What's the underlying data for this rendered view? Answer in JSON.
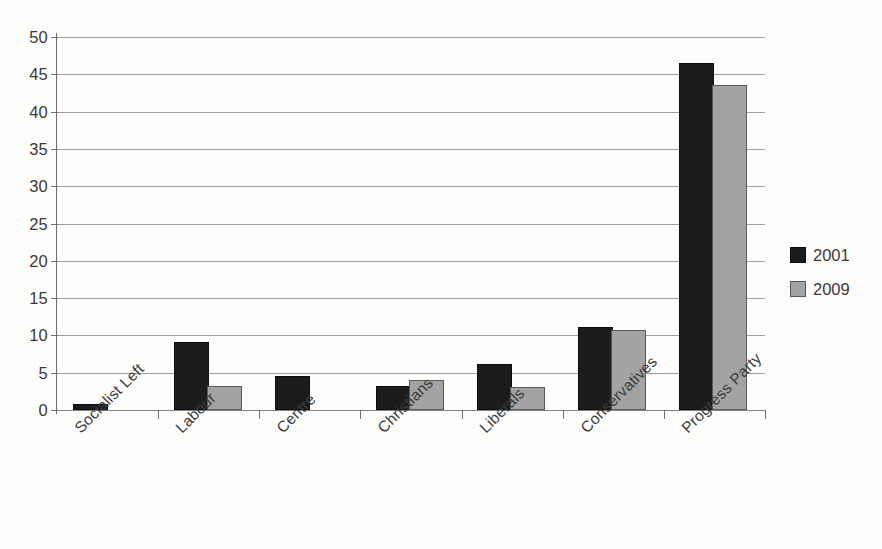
{
  "chart_data": {
    "type": "bar",
    "title": "",
    "subtitle": "",
    "xlabel": "",
    "ylabel": "",
    "ylim": [
      0,
      50
    ],
    "ytick_step": 5,
    "yticks": [
      0,
      5,
      10,
      15,
      20,
      25,
      30,
      35,
      40,
      45,
      50
    ],
    "grid": true,
    "grid_axis": "y",
    "legend_position": "right",
    "bar_label_rotation": -45,
    "categories": [
      "Socialist Left",
      "Labour",
      "Centre",
      "Christians",
      "Liberals",
      "Conservatives",
      "Progress Party"
    ],
    "series": [
      {
        "name": "2001",
        "color": "#1c1c1c",
        "values": [
          0.6,
          8.8,
          4.3,
          2.9,
          5.9,
          10.9,
          46.2
        ]
      },
      {
        "name": "2009",
        "color": "#a3a3a3",
        "values": [
          0,
          2.9,
          0,
          3.8,
          2.8,
          10.4,
          43.3
        ]
      }
    ]
  },
  "legend": {
    "entries": [
      {
        "label": "2001",
        "swatch": "dark-square-swatch"
      },
      {
        "label": "2009",
        "swatch": "gray-square-swatch"
      }
    ]
  },
  "colors": {
    "series_2001": "#1c1c1c",
    "series_2009": "#a3a3a3",
    "gridline": "#8d8d8d",
    "axis": "#6f6f6f",
    "text": "#3a3a3a",
    "background": "#fdfdfc"
  }
}
